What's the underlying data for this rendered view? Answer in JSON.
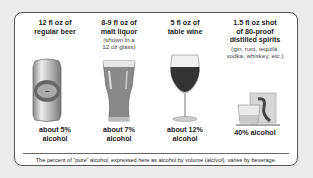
{
  "drinks": [
    {
      "name": "beer",
      "header_lines": [
        "12 fl oz of",
        "regular beer"
      ],
      "sub_lines": [],
      "footer_lines": [
        "about 5%",
        "alcohol"
      ],
      "icon": "beer-can-icon"
    },
    {
      "name": "malt-liquor",
      "header_lines": [
        "8-9 fl oz of",
        "malt liquor"
      ],
      "sub_lines": [
        "(shown in a",
        "12 oz glass)"
      ],
      "footer_lines": [
        "about 7%",
        "alcohol"
      ],
      "icon": "beer-glass-icon"
    },
    {
      "name": "wine",
      "header_lines": [
        "5 fl oz of",
        "table wine"
      ],
      "sub_lines": [],
      "footer_lines": [
        "about 12%",
        "alcohol"
      ],
      "icon": "wine-glass-icon"
    },
    {
      "name": "spirits",
      "header_lines": [
        "1.5 fl oz shot",
        "of 80-proof",
        "distilled spirits"
      ],
      "sub_lines": [
        "(gin, rum, tequila,",
        "vodka, whiskey, etc.)"
      ],
      "footer_lines": [
        "40% alcohol"
      ],
      "icon": "shot-glass-icon"
    }
  ],
  "note": "The percent of \"pure\" alcohol, expressed here as alcohol by volume (alc/vol), varies by beverage."
}
